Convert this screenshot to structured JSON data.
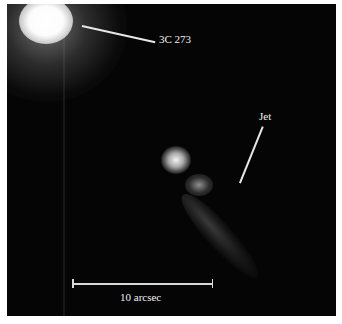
{
  "image": {
    "subject": "quasar 3C 273 with optical jet",
    "background_color": "#050505",
    "border_color": "#ffffff"
  },
  "annotations": {
    "quasar_label": "3C 273",
    "jet_label": "Jet",
    "scale_label": "10 arcsec"
  }
}
